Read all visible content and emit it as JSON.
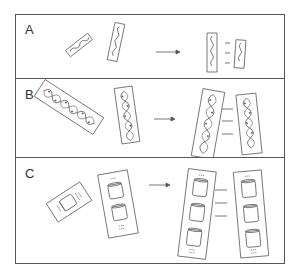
{
  "figure": {
    "panels": [
      {
        "label": "A",
        "left_items": [
          "short-crystal",
          "long-crystal"
        ],
        "right_items": [
          "long-crystal",
          "short-crystal"
        ],
        "bond_lines": 3
      },
      {
        "label": "B",
        "left_items": [
          "helix-crystal-diagonal",
          "helix-crystal-upright"
        ],
        "right_items": [
          "helix-crystal",
          "helix-crystal"
        ],
        "bond_lines": 3
      },
      {
        "label": "C",
        "left_items": [
          "single-unit-crystal",
          "double-unit-crystal"
        ],
        "right_items": [
          "triple-unit-crystal",
          "triple-unit-crystal"
        ],
        "bond_lines": 3
      }
    ],
    "colors": {
      "line": "#555555",
      "background": "#ffffff",
      "text": "#333333"
    }
  }
}
